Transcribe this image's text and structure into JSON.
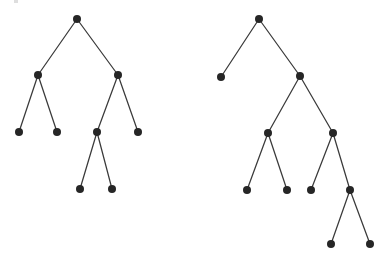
{
  "figure": {
    "title": "",
    "background_color": "#ffffff",
    "node_color": "#262626",
    "edge_color": "#3a3a3a",
    "node_radius": 4,
    "edge_width": 1.25,
    "width": 389,
    "height": 260
  },
  "chart_data": {
    "type": "diagram",
    "diagram_kind": "binary-tree-pair",
    "title": "",
    "xlabel": "",
    "ylabel": "",
    "grid": false,
    "legend": null,
    "annotations": [],
    "trees": [
      {
        "name": "left-tree",
        "node_count": 9,
        "leaf_count": 5,
        "depth": 4,
        "nodes": [
          {
            "id": "L0",
            "x": 77,
            "y": 19,
            "depth": 0,
            "label": ""
          },
          {
            "id": "L1",
            "x": 38,
            "y": 75,
            "depth": 1,
            "label": ""
          },
          {
            "id": "L2",
            "x": 118,
            "y": 75,
            "depth": 1,
            "label": ""
          },
          {
            "id": "L3",
            "x": 19,
            "y": 132,
            "depth": 2,
            "label": ""
          },
          {
            "id": "L4",
            "x": 57,
            "y": 132,
            "depth": 2,
            "label": ""
          },
          {
            "id": "L5",
            "x": 97,
            "y": 132,
            "depth": 2,
            "label": ""
          },
          {
            "id": "L6",
            "x": 138,
            "y": 132,
            "depth": 2,
            "label": ""
          },
          {
            "id": "L7",
            "x": 80,
            "y": 189,
            "depth": 3,
            "label": ""
          },
          {
            "id": "L8",
            "x": 112,
            "y": 189,
            "depth": 3,
            "label": ""
          }
        ],
        "edges": [
          {
            "from": "L0",
            "to": "L1"
          },
          {
            "from": "L0",
            "to": "L2"
          },
          {
            "from": "L1",
            "to": "L3"
          },
          {
            "from": "L1",
            "to": "L4"
          },
          {
            "from": "L2",
            "to": "L5"
          },
          {
            "from": "L2",
            "to": "L6"
          },
          {
            "from": "L5",
            "to": "L7"
          },
          {
            "from": "L5",
            "to": "L8"
          }
        ]
      },
      {
        "name": "right-tree",
        "node_count": 11,
        "leaf_count": 6,
        "depth": 5,
        "nodes": [
          {
            "id": "R0",
            "x": 259,
            "y": 19,
            "depth": 0,
            "label": ""
          },
          {
            "id": "R1",
            "x": 221,
            "y": 77,
            "depth": 1,
            "label": ""
          },
          {
            "id": "R2",
            "x": 300,
            "y": 76,
            "depth": 1,
            "label": ""
          },
          {
            "id": "R3",
            "x": 268,
            "y": 133,
            "depth": 2,
            "label": ""
          },
          {
            "id": "R4",
            "x": 333,
            "y": 133,
            "depth": 2,
            "label": ""
          },
          {
            "id": "R5",
            "x": 247,
            "y": 190,
            "depth": 3,
            "label": ""
          },
          {
            "id": "R6",
            "x": 287,
            "y": 190,
            "depth": 3,
            "label": ""
          },
          {
            "id": "R7",
            "x": 311,
            "y": 190,
            "depth": 3,
            "label": ""
          },
          {
            "id": "R8",
            "x": 350,
            "y": 190,
            "depth": 3,
            "label": ""
          },
          {
            "id": "R9",
            "x": 331,
            "y": 244,
            "depth": 4,
            "label": ""
          },
          {
            "id": "R10",
            "x": 370,
            "y": 244,
            "depth": 4,
            "label": ""
          }
        ],
        "edges": [
          {
            "from": "R0",
            "to": "R1"
          },
          {
            "from": "R0",
            "to": "R2"
          },
          {
            "from": "R2",
            "to": "R3"
          },
          {
            "from": "R2",
            "to": "R4"
          },
          {
            "from": "R3",
            "to": "R5"
          },
          {
            "from": "R3",
            "to": "R6"
          },
          {
            "from": "R4",
            "to": "R7"
          },
          {
            "from": "R4",
            "to": "R8"
          },
          {
            "from": "R8",
            "to": "R9"
          },
          {
            "from": "R8",
            "to": "R10"
          }
        ]
      }
    ]
  }
}
